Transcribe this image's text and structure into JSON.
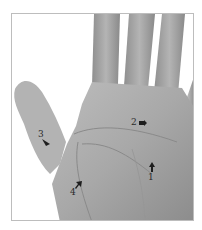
{
  "figure": {
    "colors": {
      "background": "#ffffff",
      "frame_border": "#bdbdbd",
      "skin_light": "#c8c8c8",
      "skin_mid": "#a9a9a9",
      "skin_dark": "#7a7a7a",
      "annotation": "#1e1e1e"
    },
    "annotations": [
      {
        "id": 1,
        "label": "1",
        "arrow_direction": "up"
      },
      {
        "id": 2,
        "label": "2",
        "arrow_direction": "right"
      },
      {
        "id": 3,
        "label": "3",
        "arrow_direction": "down-right"
      },
      {
        "id": 4,
        "label": "4",
        "arrow_direction": "up-right"
      }
    ]
  }
}
